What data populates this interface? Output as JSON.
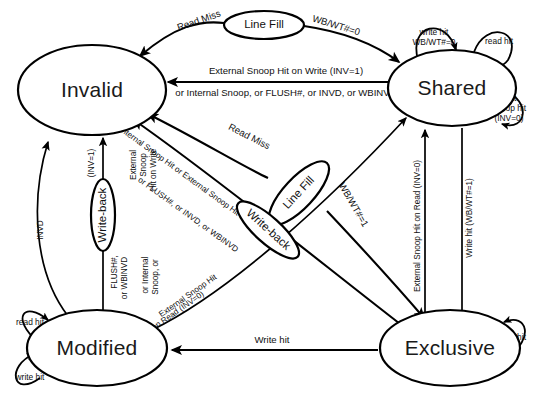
{
  "diagram": {
    "type": "state-diagram",
    "background_color": "#ffffff",
    "line_color": "#000000",
    "states": [
      {
        "id": "invalid",
        "label": "Invalid",
        "cx": 92,
        "cy": 90,
        "rx": 74,
        "ry": 45
      },
      {
        "id": "shared",
        "label": "Shared",
        "cx": 452,
        "cy": 88,
        "rx": 64,
        "ry": 38
      },
      {
        "id": "modified",
        "label": "Modified",
        "cx": 97,
        "cy": 348,
        "rx": 70,
        "ry": 38
      },
      {
        "id": "exclusive",
        "label": "Exclusive",
        "cx": 450,
        "cy": 348,
        "rx": 70,
        "ry": 38
      }
    ],
    "bubbles": [
      {
        "id": "line-fill-top",
        "label": "Line Fill",
        "cx": 264,
        "cy": 25,
        "rx": 40,
        "ry": 14,
        "rotate": 0
      },
      {
        "id": "line-fill-mid",
        "label": "Line Fill",
        "cx": 299,
        "cy": 193,
        "rx": 41,
        "ry": 15,
        "rotate": -47
      },
      {
        "id": "write-back-mid",
        "label": "Write-back",
        "cx": 268,
        "cy": 230,
        "rx": 40,
        "ry": 13,
        "rotate": 42
      },
      {
        "id": "write-back-left",
        "label": "Write-back",
        "cx": 103,
        "cy": 215,
        "rx": 36,
        "ry": 12,
        "rotate": -90
      }
    ],
    "transitions": [
      {
        "id": "invalid-to-shared-readmiss",
        "from": "invalid",
        "to": "shared",
        "labels": [
          "Read Miss",
          "WB/WT#=0"
        ]
      },
      {
        "id": "shared-to-invalid-snoop",
        "from": "shared",
        "to": "invalid",
        "labels": [
          "External Snoop Hit on Write (INV=1)",
          "or Internal Snoop, or FLUSH#, or INVD, or WBINVD"
        ]
      },
      {
        "id": "invalid-to-exclusive-readmiss",
        "from": "invalid",
        "to": "exclusive",
        "labels": [
          "Read Miss",
          "WB/WT#=1"
        ]
      },
      {
        "id": "exclusive-to-invalid-snoop",
        "from": "exclusive",
        "to": "invalid",
        "labels": [
          "Internal Snoop Hit or External Snoop Hit on Write (INV=1)",
          "or FLUSH#, or INVD, or WBINVD"
        ]
      },
      {
        "id": "modified-to-invalid-snoop",
        "from": "modified",
        "to": "invalid",
        "labels": [
          "External Snoop Hit on Write (INV=1)",
          "or Internal Snoop, or FLUSH#, or WBINVD"
        ]
      },
      {
        "id": "modified-to-invalid-invd",
        "from": "modified",
        "to": "invalid",
        "labels": [
          "INVD"
        ]
      },
      {
        "id": "modified-to-shared-read",
        "from": "modified",
        "to": "shared",
        "labels": [
          "External Snoop Hit",
          "on Read (INV=0)"
        ]
      },
      {
        "id": "exclusive-to-shared-read",
        "from": "exclusive",
        "to": "shared",
        "labels": [
          "External Snoop Hit on Read (INV=0)"
        ]
      },
      {
        "id": "shared-to-exclusive-writehit",
        "from": "shared",
        "to": "exclusive",
        "labels": [
          "Write hit (WB/WT#=1)"
        ]
      },
      {
        "id": "exclusive-to-modified-writehit",
        "from": "exclusive",
        "to": "modified",
        "labels": [
          "Write hit"
        ]
      }
    ],
    "self_loops": [
      {
        "id": "shared-write-hit",
        "state": "shared",
        "label": "write hit\nWB/WT#=0"
      },
      {
        "id": "shared-read-hit",
        "state": "shared",
        "label": "read hit"
      },
      {
        "id": "shared-ext-snoop-hit",
        "state": "shared",
        "label": "ext.\nsnoop hit\n(INV=0)"
      },
      {
        "id": "modified-read-hit",
        "state": "modified",
        "label": "read hit"
      },
      {
        "id": "modified-write-hit",
        "state": "modified",
        "label": "write hit"
      },
      {
        "id": "exclusive-read-hit",
        "state": "exclusive",
        "label": "read hit"
      }
    ],
    "labels": {
      "state_invalid": "Invalid",
      "state_shared": "Shared",
      "state_modified": "Modified",
      "state_exclusive": "Exclusive",
      "bubble_line_fill_top": "Line Fill",
      "bubble_line_fill_mid": "Line Fill",
      "bubble_write_back_mid": "Write-back",
      "bubble_write_back_left": "Write-back",
      "read_miss_top": "Read Miss",
      "wb_wt_0_top": "WB/WT#=0",
      "read_miss_mid": "Read Miss",
      "wb_wt_1_mid": "WB/WT#=1",
      "ext_snoop_write_inv1_top": "External Snoop Hit on Write (INV=1)",
      "or_internal_snoop_top": "or Internal Snoop, or FLUSH#, or INVD, or WBINVD",
      "ext_snoop_write_inv1_left": "External",
      "ext_snoop_write_inv1_left2": "Snoop",
      "ext_snoop_write_inv1_left3": "Hit on Write",
      "ext_snoop_write_inv1_left4": "(INV=1)",
      "or_internal_left": "or Internal",
      "or_internal_left2": "Snoop, or",
      "or_flush_left": "FLUSH#,",
      "or_wbinvd_left": "or WBINVD",
      "invd_left": "INVD",
      "internal_snoop_diag": "Internal Snoop Hit or External Snoop Hit on Write (INV=1)",
      "internal_snoop_diag2": "or FLUSH#, or INVD, or WBINVD",
      "ext_snoop_read_inv0_diag": "External Snoop Hit",
      "ext_snoop_read_inv0_diag2": "on Read (INV=0)",
      "ext_snoop_read_inv0_vert": "External Snoop Hit on Read (INV=0)",
      "write_hit_wb_wt1_vert": "Write hit (WB/WT#=1)",
      "write_hit_bottom": "Write hit",
      "loop_shared_write_hit_1": "write hit",
      "loop_shared_write_hit_2": "WB/WT#=0",
      "loop_shared_read_hit": "read hit",
      "loop_shared_ext_1": "ext.",
      "loop_shared_ext_2": "snoop hit",
      "loop_shared_ext_3": "(INV=0)",
      "loop_modified_read_hit": "read hit",
      "loop_modified_write_hit": "write hit",
      "loop_exclusive_read_hit": "read hit"
    }
  }
}
